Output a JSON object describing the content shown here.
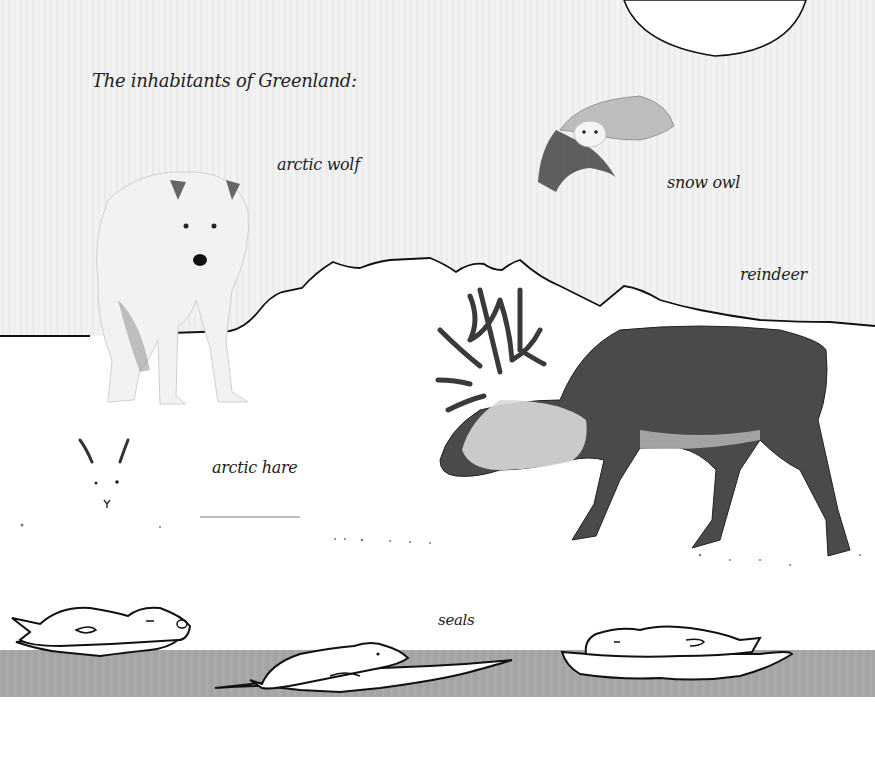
{
  "page": {
    "title": "The inhabitants of Greenland:",
    "labels": {
      "arctic_wolf": "arctic wolf",
      "snow_owl": "snow owl",
      "reindeer": "reindeer",
      "arctic_hare": "arctic hare",
      "seals": "seals"
    }
  },
  "colors": {
    "sky": "#efefef",
    "snow": "#ffffff",
    "water": "#a8a8a8",
    "outline": "#111111",
    "text": "#222222"
  },
  "illustrations": [
    {
      "name": "sun",
      "kind": "drawing"
    },
    {
      "name": "mountain-horizon",
      "kind": "drawing"
    },
    {
      "name": "arctic-wolf",
      "kind": "photo"
    },
    {
      "name": "snow-owl",
      "kind": "photo"
    },
    {
      "name": "reindeer",
      "kind": "photo"
    },
    {
      "name": "arctic-hare",
      "kind": "photo"
    },
    {
      "name": "seal-left",
      "kind": "drawing"
    },
    {
      "name": "seal-middle",
      "kind": "drawing"
    },
    {
      "name": "seal-right",
      "kind": "drawing"
    }
  ]
}
